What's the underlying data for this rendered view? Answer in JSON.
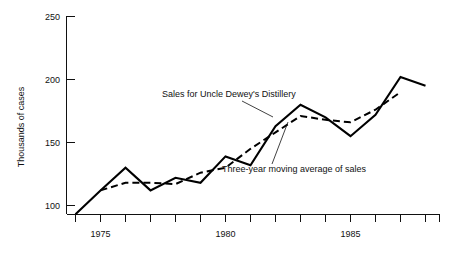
{
  "chart_data": {
    "type": "line",
    "title": "",
    "xlabel": "",
    "ylabel": "Thousands of cases",
    "xlim": [
      1974,
      1988
    ],
    "ylim": [
      75,
      250
    ],
    "grid": false,
    "legend_position": "inline-annotations",
    "x": [
      1974,
      1975,
      1976,
      1977,
      1978,
      1979,
      1980,
      1981,
      1982,
      1983,
      1984,
      1985,
      1986,
      1987,
      1988
    ],
    "y_tick_values": [
      100,
      150,
      200,
      250
    ],
    "y_tick_labels": [
      "100",
      "150",
      "200",
      "250"
    ],
    "x_tick_values": [
      1974,
      1975,
      1976,
      1977,
      1978,
      1979,
      1980,
      1981,
      1982,
      1983,
      1984,
      1985,
      1986,
      1987,
      1988
    ],
    "x_tick_labels": [
      "",
      "1975",
      "",
      "",
      "",
      "",
      "1980",
      "",
      "",
      "",
      "",
      "1985",
      "",
      "",
      ""
    ],
    "series": [
      {
        "name": "Sales for Uncle Dewey's Distillery",
        "style": "solid",
        "values": [
          93,
          112,
          130,
          112,
          122,
          118,
          139,
          132,
          163,
          180,
          170,
          155,
          172,
          202,
          195
        ]
      },
      {
        "name": "Three-year moving average of sales",
        "style": "dashed",
        "values": [
          null,
          112,
          118,
          118,
          117,
          126,
          130,
          145,
          158,
          171,
          168,
          166,
          176,
          190,
          null
        ]
      }
    ],
    "annotations": [
      {
        "text": "Sales for Uncle Dewey's Distillery",
        "target_series": "Sales for Uncle Dewey's Distillery"
      },
      {
        "text": "Three-year moving average of sales",
        "target_series": "Three-year moving average of sales"
      }
    ]
  }
}
